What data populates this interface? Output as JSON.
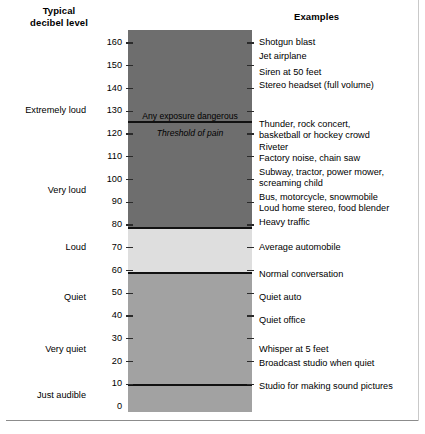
{
  "headers": {
    "left": "Typical\ndecibel level",
    "right": "Examples"
  },
  "bar": {
    "annotations": {
      "danger": "Any exposure dangerous",
      "pain": "Threshold of pain"
    }
  },
  "chart_data": {
    "type": "bar",
    "title": "Typical decibel level",
    "xlabel": "",
    "ylabel": "Decibel level (dB)",
    "ylim": [
      0,
      165
    ],
    "grid": false,
    "legend": null,
    "axis_ticks": [
      0,
      10,
      20,
      30,
      40,
      50,
      60,
      70,
      80,
      90,
      100,
      110,
      120,
      130,
      140,
      150,
      160
    ],
    "tick_labels": [
      "0",
      "10",
      "20",
      "30",
      "40",
      "50",
      "60",
      "70",
      "80",
      "90",
      "100",
      "110",
      "120",
      "130",
      "140",
      "150",
      "160"
    ],
    "bands": [
      {
        "name": "dangerous-zone",
        "from": 80,
        "to": 165,
        "shade": "#6e6e6e"
      },
      {
        "name": "loud-zone",
        "from": 60,
        "to": 80,
        "shade": "#dedede"
      },
      {
        "name": "quiet-zone",
        "from": 0,
        "to": 60,
        "shade": "#a2a2a2"
      }
    ],
    "rules": [
      {
        "label": "Threshold of pain",
        "db": 125
      },
      {
        "label": "80 dB boundary",
        "db": 80
      },
      {
        "label": "60 dB boundary",
        "db": 60
      },
      {
        "label": "10 dB boundary",
        "db": 10
      }
    ],
    "categories": [
      {
        "label": "Extremely loud",
        "db": 130
      },
      {
        "label": "Very loud",
        "db": 95
      },
      {
        "label": "Loud",
        "db": 70
      },
      {
        "label": "Quiet",
        "db": 48
      },
      {
        "label": "Very quiet",
        "db": 25
      },
      {
        "label": "Just audible",
        "db": 5
      }
    ],
    "examples": [
      {
        "text": "Shotgun blast",
        "db": 160
      },
      {
        "text": "Jet airplane",
        "db": 154
      },
      {
        "text": "Siren at 50 feet",
        "db": 147
      },
      {
        "text": "Stereo headset (full volume)",
        "db": 141
      },
      {
        "text": "Thunder, rock concert,",
        "db": 124
      },
      {
        "text": "basketball or hockey crowd",
        "db": 119
      },
      {
        "text": "Riveter",
        "db": 114
      },
      {
        "text": "Factory noise, chain saw",
        "db": 109
      },
      {
        "text": "Subway, tractor, power mower,",
        "db": 103
      },
      {
        "text": "screaming child",
        "db": 98
      },
      {
        "text": "Bus, motorcycle, snowmobile",
        "db": 92
      },
      {
        "text": "Loud home stereo, food blender",
        "db": 87
      },
      {
        "text": "Heavy traffic",
        "db": 81
      },
      {
        "text": "Average automobile",
        "db": 70
      },
      {
        "text": "Normal conversation",
        "db": 58
      },
      {
        "text": "Quiet auto",
        "db": 48
      },
      {
        "text": "Quiet office",
        "db": 38
      },
      {
        "text": "Whisper at 5 feet",
        "db": 25
      },
      {
        "text": "Broadcast studio when quiet",
        "db": 19
      },
      {
        "text": "Studio for making sound pictures",
        "db": 9
      }
    ]
  }
}
